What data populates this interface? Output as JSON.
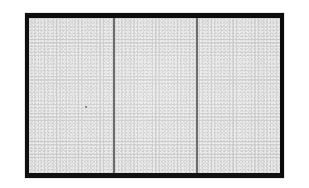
{
  "figure": {
    "kind": "grayscale-micrograph",
    "description": "Rectangular specimen with dark outer frame, fine stippled granular interior, divided into three vertical panels by two thin dark lines",
    "background_color": "#ffffff",
    "frame": {
      "name": "specimen-frame",
      "color": "#121212",
      "border_thickness_px": 4,
      "x": 25,
      "y": 13,
      "width": 259,
      "height": 165
    },
    "field": {
      "name": "stippled-field",
      "base_color": "#c9c9c9",
      "speck_color": "#eeeeee",
      "texture": "fine stipple / granular speckle",
      "speck_spacing_px": 3
    },
    "dividers": [
      {
        "name": "divider-1",
        "x": 113,
        "width_px": 2,
        "color": "#444444",
        "orientation": "vertical"
      },
      {
        "name": "divider-2",
        "x": 196,
        "width_px": 2,
        "color": "#444444",
        "orientation": "vertical"
      }
    ],
    "panels": [
      {
        "name": "panel-left",
        "index": 1,
        "label": ""
      },
      {
        "name": "panel-center",
        "index": 2,
        "label": ""
      },
      {
        "name": "panel-right",
        "index": 3,
        "label": ""
      }
    ],
    "artifacts": [
      {
        "name": "inclusion-speck",
        "x": 85,
        "y": 106,
        "color": "#6f6f6f",
        "size_px": 2
      }
    ]
  },
  "labels": {
    "caption": "",
    "scale_bar": "",
    "axis": ""
  }
}
